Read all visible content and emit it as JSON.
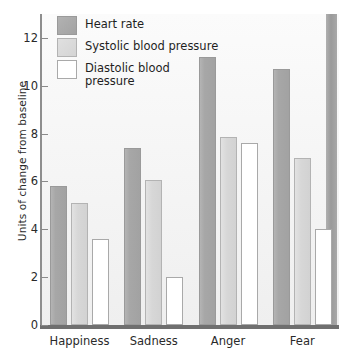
{
  "chart_data": {
    "type": "bar",
    "title": "",
    "xlabel": "",
    "ylabel": "Units of change from baseline",
    "categories": [
      "Happiness",
      "Sadness",
      "Anger",
      "Fear"
    ],
    "series": [
      {
        "name": "Heart rate",
        "values": [
          5.8,
          7.4,
          11.2,
          10.7
        ],
        "color": "#a7a7a7"
      },
      {
        "name": "Systolic blood pressure",
        "values": [
          5.1,
          6.05,
          7.85,
          7.0
        ],
        "color": "#d7d7d7"
      },
      {
        "name": "Diastolic blood\npressure",
        "values": [
          3.6,
          2.0,
          7.6,
          4.0
        ],
        "color": "#ffffff"
      }
    ],
    "ylim": [
      0,
      13
    ],
    "yticks": [
      0,
      2,
      4,
      6,
      8,
      10,
      12
    ],
    "ytick_labels": [
      "0",
      "2",
      "4",
      "6",
      "8",
      "10",
      "12"
    ],
    "grid": false,
    "legend_position": "top-left"
  },
  "legend": {
    "items": [
      {
        "label": "Heart rate",
        "swatch": "heart-rate-swatch"
      },
      {
        "label": "Systolic blood pressure",
        "swatch": "systolic-swatch"
      },
      {
        "label": "Diastolic blood\npressure",
        "swatch": "diastolic-swatch"
      }
    ]
  }
}
